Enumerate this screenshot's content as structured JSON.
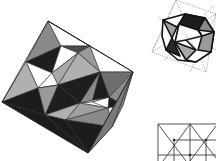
{
  "figures": [
    {
      "name": "octahedron-faceted-projection",
      "description": "Large square-outline polyhedron with triangular faces shaded in black, dark gray, mid gray, and white",
      "colors": {
        "black": "#1c1c1c",
        "dark": "#4a4a4a",
        "mid": "#8c8c8c",
        "light": "#b4b4b4",
        "white": "#ffffff",
        "edge": "#222222"
      }
    },
    {
      "name": "cuboctahedron-with-dashed-octahedron",
      "description": "Small polyhedron with thick black edges inside a dotted-line octahedron outline"
    },
    {
      "name": "triangulated-grid",
      "description": "Partial rectangular grid with diagonal lines forming triangles"
    }
  ]
}
